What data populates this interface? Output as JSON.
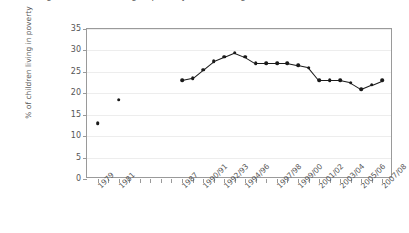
{
  "figure": {
    "title_cropped": "Percentage of children living in poverty, United Kingdom",
    "ylabel": "% of children living in poverty"
  },
  "chart_data": {
    "type": "line",
    "title": "Percentage of children living in poverty, United Kingdom",
    "xlabel": "",
    "ylabel": "% of children living in poverty",
    "ylim": [
      0,
      35
    ],
    "yticks": [
      0,
      5,
      10,
      15,
      20,
      25,
      30,
      35
    ],
    "grid": true,
    "legend": null,
    "categories": [
      "1979",
      "1980",
      "1981",
      "1982",
      "1983",
      "1984",
      "1985",
      "1986",
      "1987",
      "1988/89",
      "1990/91",
      "1991/92",
      "1992/93",
      "1993/94",
      "1994/95",
      "1995/96",
      "1996/97",
      "1997/98",
      "1998/99",
      "1999/00",
      "2000/01",
      "2001/02",
      "2002/03",
      "2003/04",
      "2004/05",
      "2005/06",
      "2006/07",
      "2007/08"
    ],
    "tick_labels": [
      "1979",
      "1981",
      "1987",
      "1990/91",
      "1992/93",
      "1994/96",
      "1997/98",
      "1999/00",
      "2001/02",
      "2003/04",
      "2005/06",
      "2007/08"
    ],
    "values": [
      13,
      null,
      18.5,
      null,
      null,
      null,
      null,
      null,
      23,
      23.5,
      25.5,
      27.5,
      28.5,
      29.5,
      28.5,
      27,
      27,
      27,
      27,
      26.5,
      26,
      23,
      23,
      23,
      22.5,
      21,
      22,
      23
    ],
    "series": [
      {
        "name": "% of children living in poverty",
        "connected_from_index": 8,
        "points": [
          {
            "x": "1979",
            "y": 13,
            "connected": false
          },
          {
            "x": "1981",
            "y": 18.5,
            "connected": false
          },
          {
            "x": "1987",
            "y": 23,
            "connected": true
          },
          {
            "x": "1988/89",
            "y": 23.5,
            "connected": true
          },
          {
            "x": "1990/91",
            "y": 25.5,
            "connected": true
          },
          {
            "x": "1991/92",
            "y": 27.5,
            "connected": true
          },
          {
            "x": "1992/93",
            "y": 28.5,
            "connected": true
          },
          {
            "x": "1993/94",
            "y": 29.5,
            "connected": true
          },
          {
            "x": "1994/95",
            "y": 28.5,
            "connected": true
          },
          {
            "x": "1995/96",
            "y": 27,
            "connected": true
          },
          {
            "x": "1996/97",
            "y": 27,
            "connected": true
          },
          {
            "x": "1997/98",
            "y": 27,
            "connected": true
          },
          {
            "x": "1998/99",
            "y": 27,
            "connected": true
          },
          {
            "x": "1999/00",
            "y": 26.5,
            "connected": true
          },
          {
            "x": "2000/01",
            "y": 26,
            "connected": true
          },
          {
            "x": "2001/02",
            "y": 23,
            "connected": true
          },
          {
            "x": "2002/03",
            "y": 23,
            "connected": true
          },
          {
            "x": "2003/04",
            "y": 23,
            "connected": true
          },
          {
            "x": "2004/05",
            "y": 22.5,
            "connected": true
          },
          {
            "x": "2005/06",
            "y": 21,
            "connected": true
          },
          {
            "x": "2006/07",
            "y": 22,
            "connected": true
          },
          {
            "x": "2007/08",
            "y": 23,
            "connected": true
          }
        ]
      }
    ],
    "colors": {
      "marker": "#1a1a1a",
      "line": "#1a1a1a",
      "grid": "#ededed",
      "axis": "#9a9a9a",
      "text": "#555555"
    }
  }
}
